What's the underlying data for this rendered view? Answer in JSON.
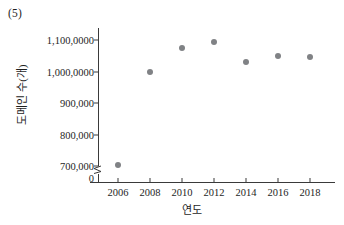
{
  "caption": "(5)",
  "chart_data": {
    "type": "scatter",
    "title": "",
    "xlabel": "연도",
    "ylabel": "도메인 수(개)",
    "x": [
      2006,
      2008,
      2010,
      2012,
      2014,
      2016,
      2018
    ],
    "values": [
      702000,
      1000000,
      1075000,
      1095000,
      1030000,
      1048000,
      1045000
    ],
    "categories": [
      "2006",
      "2008",
      "2010",
      "2012",
      "2014",
      "2016",
      "2018"
    ],
    "xtick_labels": [
      "2006",
      "2008",
      "2010",
      "2012",
      "2014",
      "2016",
      "2018"
    ],
    "ytick_labels": [
      "0",
      "700,000",
      "800,000",
      "900,000",
      "1,000,0000",
      "1,100,0000"
    ],
    "ytick_values": [
      0,
      700000,
      800000,
      900000,
      1000000,
      1100000
    ],
    "xlim": [
      2005,
      2019
    ],
    "ylim": [
      690000,
      1130000
    ],
    "axis_break": true,
    "grid": false,
    "legend": "none",
    "marker_color": "#808285",
    "axis_color": "#3a3a3a"
  }
}
